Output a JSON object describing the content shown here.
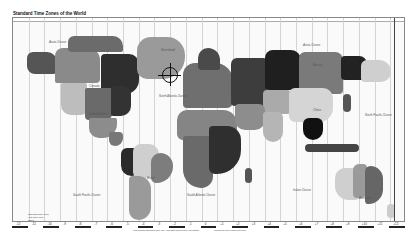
{
  "map": {
    "title": "Standard Time Zones of the World",
    "ocean_labels": [
      {
        "name": "Arctic Ocean",
        "x": 36,
        "y": 22
      },
      {
        "name": "Arctic Ocean",
        "x": 290,
        "y": 25
      },
      {
        "name": "North Atlantic Ocean",
        "x": 146,
        "y": 76
      },
      {
        "name": "North Pacific Ocean",
        "x": 352,
        "y": 95
      },
      {
        "name": "South Pacific Ocean",
        "x": 60,
        "y": 175
      },
      {
        "name": "South Atlantic Ocean",
        "x": 174,
        "y": 175
      },
      {
        "name": "Indian Ocean",
        "x": 280,
        "y": 170
      }
    ],
    "region_labels": [
      {
        "name": "Greenland",
        "x": 148,
        "y": 30
      },
      {
        "name": "Canada",
        "x": 76,
        "y": 66
      },
      {
        "name": "United States",
        "x": 76,
        "y": 94
      },
      {
        "name": "Brazil",
        "x": 134,
        "y": 158
      },
      {
        "name": "Russia",
        "x": 300,
        "y": 45
      },
      {
        "name": "China",
        "x": 300,
        "y": 90
      },
      {
        "name": "Australia",
        "x": 346,
        "y": 178
      }
    ],
    "legend": {
      "lines": [
        "Standard time zone",
        "Half-hour zone",
        "Other"
      ]
    },
    "footnotes": [
      "Map shows standard time only; daylight saving time not shown",
      "Compiled from official sources"
    ],
    "bottom_zone_labels": [
      "-12",
      "-11",
      "-10",
      "-9",
      "-8",
      "-7",
      "-6",
      "-5",
      "-4",
      "-3",
      "-2",
      "-1",
      "0",
      "+1",
      "+2",
      "+3",
      "+4",
      "+5",
      "+6",
      "+7",
      "+8",
      "+9",
      "+10",
      "+11",
      "+12"
    ],
    "marker": "Greenwich crosshair"
  }
}
